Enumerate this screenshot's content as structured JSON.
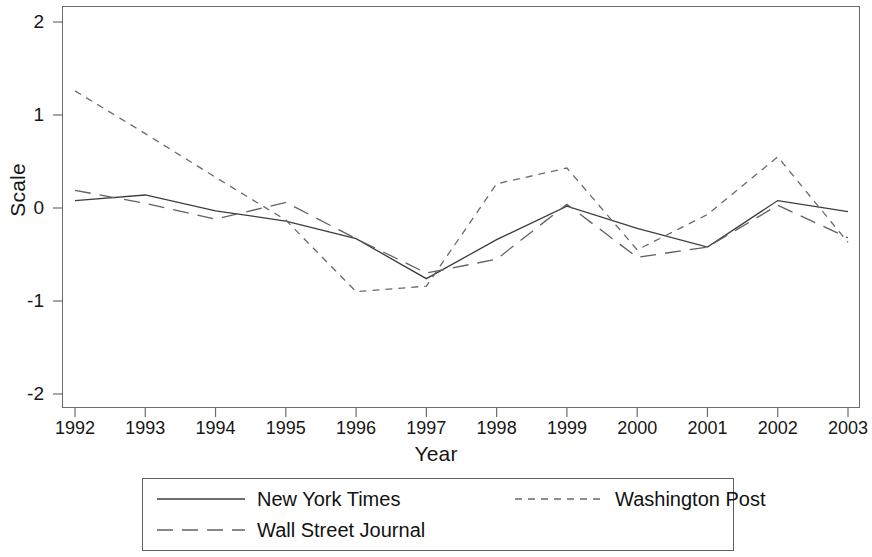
{
  "chart_data": {
    "type": "line",
    "title": "",
    "xlabel": "Year",
    "ylabel": "Scale",
    "x": [
      1992,
      1993,
      1994,
      1995,
      1996,
      1997,
      1998,
      1999,
      2000,
      2001,
      2002,
      2003
    ],
    "xtick_labels": [
      "1992",
      "1993",
      "1994",
      "1995",
      "1996",
      "1997",
      "1998",
      "1999",
      "2000",
      "2001",
      "2002",
      "2003"
    ],
    "ytick_labels": [
      "2",
      "1",
      "0",
      "-1",
      "-2"
    ],
    "ytick_values": [
      2,
      1,
      0,
      -1,
      -2
    ],
    "xlim": [
      1992,
      2003
    ],
    "ylim": [
      -2.18,
      2.18
    ],
    "grid": false,
    "legend_position": "bottom-outside",
    "series": [
      {
        "name": "New York Times",
        "style": "solid",
        "color": "#3d3d3d",
        "values": [
          0.08,
          0.14,
          -0.03,
          -0.14,
          -0.33,
          -0.76,
          -0.34,
          0.02,
          -0.22,
          -0.42,
          0.08,
          -0.04
        ]
      },
      {
        "name": "Washington Post",
        "style": "dashed",
        "color": "#6a6a6a",
        "values": [
          1.26,
          0.8,
          0.33,
          -0.13,
          -0.9,
          -0.84,
          0.26,
          0.43,
          -0.45,
          -0.07,
          0.55,
          -0.37
        ]
      },
      {
        "name": "Wall Street Journal",
        "style": "longdash",
        "color": "#616161",
        "values": [
          0.19,
          0.05,
          -0.12,
          0.06,
          -0.33,
          -0.7,
          -0.55,
          0.04,
          -0.53,
          -0.42,
          0.03,
          -0.32
        ]
      }
    ]
  },
  "legend": {
    "entries": [
      {
        "label": "New York Times"
      },
      {
        "label": "Washington Post"
      },
      {
        "label": "Wall Street Journal"
      }
    ]
  }
}
